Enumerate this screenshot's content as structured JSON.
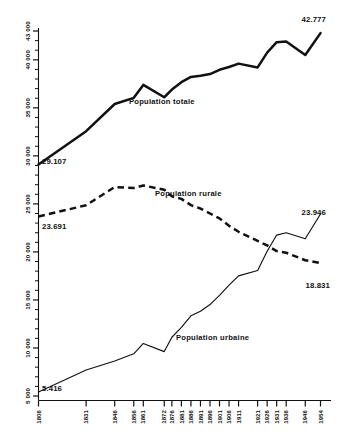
{
  "chart_data": {
    "type": "line",
    "title": "",
    "subtitle": "",
    "xlabel": "",
    "ylabel": "",
    "grid": false,
    "legend_position": "inline-annotations",
    "ylim": [
      5000,
      43000
    ],
    "yticks": [
      5000,
      10000,
      15000,
      20000,
      25000,
      30000,
      35000,
      40000,
      43000
    ],
    "ytick_labels": [
      "5 000",
      "10 000",
      "15 000",
      "20 000",
      "25 000",
      "30 000",
      "35 000",
      "40 000",
      "43 000"
    ],
    "ytick_minor_step": 1000,
    "categories": [
      "1806",
      "1831",
      "1846",
      "1856",
      "1861",
      "1872",
      "1876",
      "1881",
      "1886",
      "1891",
      "1896",
      "1901",
      "1906",
      "1911",
      "1921",
      "1926",
      "1931",
      "1936",
      "1946",
      "1954"
    ],
    "series": [
      {
        "name": "Population totale",
        "style": "solid-thick",
        "values": [
          29107,
          32569,
          35400,
          36039,
          37386,
          36103,
          36906,
          37672,
          38219,
          38343,
          38517,
          38962,
          39252,
          39605,
          39210,
          40744,
          41835,
          41907,
          40507,
          42777
        ]
      },
      {
        "name": "Population rurale",
        "style": "dashed-thick",
        "values": [
          23691,
          24862,
          26753,
          26647,
          26918,
          26479,
          25787,
          25523,
          24872,
          24517,
          24000,
          23491,
          22715,
          22096,
          21139,
          20679,
          20082,
          19915,
          19135,
          18831
        ]
      },
      {
        "name": "Population urbaine",
        "style": "solid-thin",
        "values": [
          5416,
          7707,
          8647,
          9392,
          10468,
          9624,
          11119,
          12149,
          13347,
          13826,
          14517,
          15471,
          16537,
          17509,
          18071,
          20065,
          21753,
          21992,
          21372,
          23946
        ]
      }
    ],
    "annotations": [
      {
        "name": "total-start-value",
        "text": "29.107",
        "series": "Population totale",
        "at": "1806"
      },
      {
        "name": "total-end-value",
        "text": "42.777",
        "series": "Population totale",
        "at": "1954"
      },
      {
        "name": "rurale-start-value",
        "text": "23.691",
        "series": "Population rurale",
        "at": "1806"
      },
      {
        "name": "rurale-end-value",
        "text": "18.831",
        "series": "Population rurale",
        "at": "1954"
      },
      {
        "name": "urbaine-start-value",
        "text": "5.416",
        "series": "Population urbaine",
        "at": "1806"
      },
      {
        "name": "urbaine-end-value",
        "text": "23.946",
        "series": "Population urbaine",
        "at": "1954"
      }
    ],
    "series_labels": {
      "totale": "Population totale",
      "rurale": "Population rurale",
      "urbaine": "Population urbaine"
    },
    "colors": {
      "ink": "#111111",
      "background": "#ffffff"
    }
  }
}
